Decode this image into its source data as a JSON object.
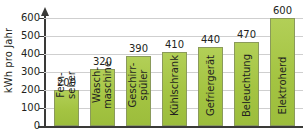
{
  "chart_data": {
    "type": "bar",
    "title": "",
    "xlabel": "",
    "ylabel": "kWh pro Jahr",
    "ylim": [
      0,
      640
    ],
    "yticks": [
      0,
      100,
      200,
      300,
      400,
      500,
      600
    ],
    "ytick_labels": [
      "0",
      "100",
      "200",
      "300",
      "400",
      "500",
      "600"
    ],
    "grid": true,
    "legend": "none",
    "categories": [
      "Fern-\nseher",
      "Wasch-\nmaschine",
      "Geschirr-\nspüler",
      "Kühlschrank",
      "Gefriergerät",
      "Beleuchtung",
      "Elektroherd"
    ],
    "category_lines": [
      [
        "Fern-",
        "seher"
      ],
      [
        "Wasch-",
        "maschine"
      ],
      [
        "Geschirr-",
        "spüler"
      ],
      [
        "Kühlschrank"
      ],
      [
        "Gefriergerät"
      ],
      [
        "Beleuchtung"
      ],
      [
        "Elektroherd"
      ]
    ],
    "values": [
      200,
      320,
      390,
      410,
      440,
      470,
      600
    ],
    "value_labels": [
      "200",
      "320",
      "390",
      "410",
      "440",
      "470",
      "600"
    ],
    "bar_color": "#a4c442",
    "bar_edge_color": "#8a9a5b",
    "axis_color": "#3a3a38",
    "grid_color": "#cfcfcf",
    "text_color": "#231f20",
    "background": "#ffffff"
  }
}
